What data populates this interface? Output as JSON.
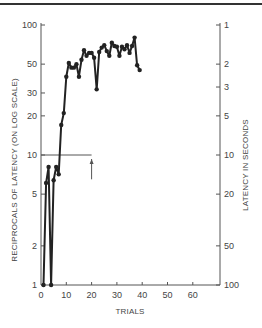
{
  "chart_data": {
    "type": "line",
    "title": "",
    "xlabel": "TRIALS",
    "ylabel": "RECIPROCALS OF LATENCY (ON LOG SCALE)",
    "ylabel_right": "LATENCY IN SECONDS",
    "xlim": [
      0,
      70
    ],
    "ylim": [
      1,
      100
    ],
    "yscale": "log",
    "x_ticks": [
      0,
      10,
      20,
      30,
      40,
      50,
      60
    ],
    "y_ticks_left": [
      1,
      2,
      5,
      10,
      20,
      30,
      50,
      100
    ],
    "y_ticks_right": [
      1,
      2,
      3,
      5,
      10,
      20,
      50,
      100
    ],
    "grid": false,
    "annotations": [
      {
        "type": "hline",
        "y": 10,
        "x_from": 0,
        "x_to": 20
      },
      {
        "type": "arrow",
        "x": 20,
        "y_from": 6.5,
        "y_to": 10,
        "direction": "up"
      }
    ],
    "series": [
      {
        "name": "reciprocal latency",
        "x": [
          1,
          2,
          3,
          4,
          5,
          6,
          7,
          8,
          9,
          10,
          11,
          12,
          13,
          14,
          15,
          16,
          17,
          18,
          19,
          20,
          21,
          22,
          23,
          24,
          25,
          26,
          27,
          28,
          29,
          30,
          31,
          32,
          33,
          34,
          35,
          36,
          37,
          38,
          39
        ],
        "values": [
          1,
          6.1,
          8.1,
          1,
          6.4,
          8.1,
          7.1,
          17,
          21,
          40,
          51,
          47,
          47,
          50,
          40,
          54,
          64,
          58,
          61,
          61,
          56,
          32,
          62,
          67,
          70,
          63,
          58,
          73,
          69,
          68,
          58,
          68,
          65,
          70,
          61,
          69,
          80,
          49,
          45
        ]
      }
    ]
  },
  "colors": {
    "line": "#222222",
    "axis": "#555555",
    "top_rule": "#333333"
  }
}
